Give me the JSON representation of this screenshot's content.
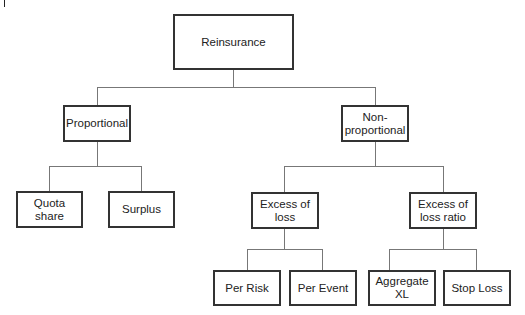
{
  "diagram": {
    "type": "tree",
    "title": "Reinsurance",
    "root": {
      "id": "reinsurance",
      "label": "Reinsurance",
      "children": [
        "proportional",
        "non_proportional"
      ]
    },
    "nodes": {
      "reinsurance": {
        "label": "Reinsurance"
      },
      "proportional": {
        "label": "Proportional"
      },
      "non_proportional": {
        "label": "Non-\nproportional"
      },
      "quota_share": {
        "label": "Quota share"
      },
      "surplus": {
        "label": "Surplus"
      },
      "excess_of_loss": {
        "label": "Excess of\nloss"
      },
      "excess_of_loss_ratio": {
        "label": "Excess of\nloss ratio"
      },
      "per_risk": {
        "label": "Per Risk"
      },
      "per_event": {
        "label": "Per Event"
      },
      "aggregate_xl": {
        "label": "Aggregate XL"
      },
      "stop_loss": {
        "label": "Stop Loss"
      }
    },
    "edges": [
      [
        "reinsurance",
        "proportional"
      ],
      [
        "reinsurance",
        "non_proportional"
      ],
      [
        "proportional",
        "quota_share"
      ],
      [
        "proportional",
        "surplus"
      ],
      [
        "non_proportional",
        "excess_of_loss"
      ],
      [
        "non_proportional",
        "excess_of_loss_ratio"
      ],
      [
        "excess_of_loss",
        "per_risk"
      ],
      [
        "excess_of_loss",
        "per_event"
      ],
      [
        "excess_of_loss_ratio",
        "aggregate_xl"
      ],
      [
        "excess_of_loss_ratio",
        "stop_loss"
      ]
    ]
  }
}
